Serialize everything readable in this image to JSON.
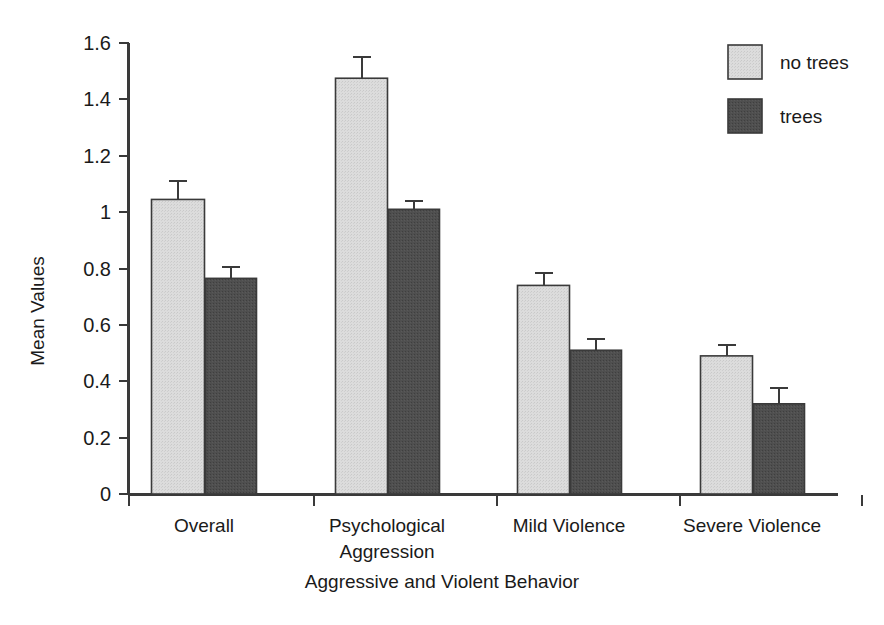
{
  "chart_data": {
    "type": "bar",
    "title": "",
    "xlabel": "Aggressive and Violent Behavior",
    "ylabel": "Mean Values",
    "categories": [
      "Overall",
      "Psychological Aggression",
      "Mild Violence",
      "Severe Violence"
    ],
    "category_lines": [
      [
        "Overall"
      ],
      [
        "Psychological",
        "Aggression"
      ],
      [
        "Mild Violence"
      ],
      [
        "Severe Violence"
      ]
    ],
    "series": [
      {
        "name": "no trees",
        "color": "#d6d6d6",
        "values": [
          1.045,
          1.475,
          0.74,
          0.49
        ],
        "errors": [
          0.065,
          0.075,
          0.045,
          0.04
        ]
      },
      {
        "name": "trees",
        "color": "#4c4c4c",
        "values": [
          0.765,
          1.01,
          0.51,
          0.32
        ],
        "errors": [
          0.04,
          0.03,
          0.04,
          0.055
        ]
      }
    ],
    "ylim": [
      0,
      1.6
    ],
    "ytick_values": [
      0,
      0.2,
      0.4,
      0.6,
      0.8,
      1.0,
      1.2,
      1.4,
      1.6
    ],
    "ytick_labels": [
      "0",
      "0.2",
      "0.4",
      "0.6",
      "0.8",
      "1",
      "1.2",
      "1.4",
      "1.6"
    ],
    "grid": false,
    "legend_position": "top-right",
    "error_bar_style": "upper-only-cap",
    "bar_outline_color": "#3a3a3a",
    "axis_color": "#3a3a3a",
    "background_color": "#ffffff"
  },
  "legend": {
    "entries": [
      {
        "label": "no trees",
        "color": "#d6d6d6"
      },
      {
        "label": "trees",
        "color": "#4c4c4c"
      }
    ]
  },
  "axes": {
    "y_title": "Mean Values",
    "x_title": "Aggressive and Violent Behavior"
  }
}
